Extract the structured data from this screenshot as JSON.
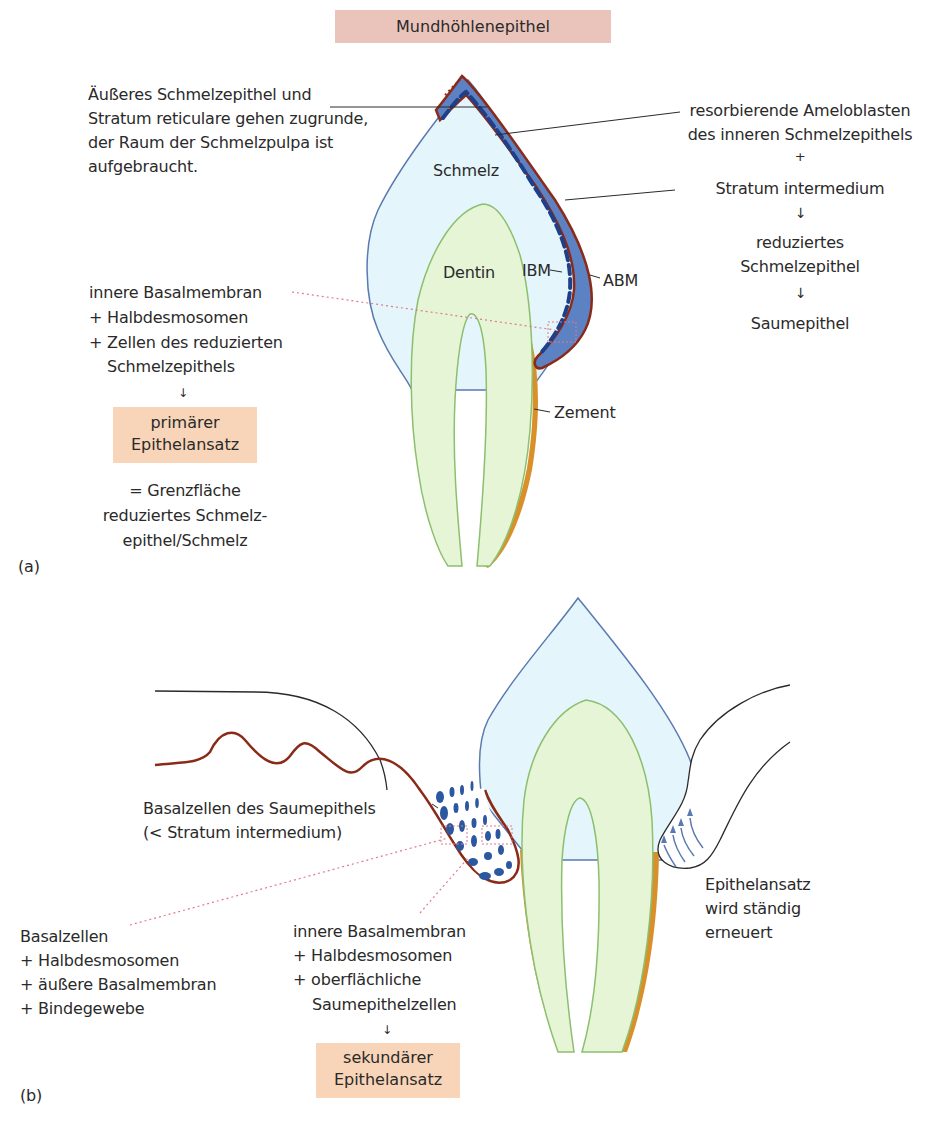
{
  "colors": {
    "enamel_fill": "#e4f6fb",
    "enamel_stroke": "#5a7ab0",
    "dentin_fill": "#e5f5d6",
    "dentin_stroke": "#8cbf6f",
    "cement": "#d9902a",
    "epithelium_brown": "#8a2a18",
    "cell_blue": "#2c58a0",
    "band_blue": "#5d82c4",
    "dotted_pink": "#e07a8a",
    "header_box": "#eac4bb",
    "attachment_box": "#f8d5b8"
  },
  "panel_a": {
    "label": "(a)",
    "header": "Mundhöhlenepithel",
    "left_note": [
      "Äußeres Schmelzepithel und",
      "Stratum reticulare gehen zugrunde,",
      "der Raum der Schmelzpulpa ist",
      "aufgebraucht."
    ],
    "tissue_labels": {
      "enamel": "Schmelz",
      "dentin": "Dentin",
      "ibm": "IBM",
      "abm": "ABM",
      "cement": "Zement"
    },
    "right_flow": {
      "line1": "resorbierende Ameloblasten",
      "line2": "des inneren Schmelzepithels",
      "plus": "+",
      "line3": "Stratum intermedium",
      "step2_line1": "reduziertes",
      "step2_line2": "Schmelzepithel",
      "step3": "Saumepithel"
    },
    "attachment_components": [
      "innere Basalmembran",
      "+ Halbdesmosomen",
      "+ Zellen des reduzierten",
      "Schmelzepithels"
    ],
    "attachment_result": [
      "primärer",
      "Epithelansatz"
    ],
    "definition": [
      "= Grenzfläche",
      "reduziertes Schmelz-",
      "epithel/Schmelz"
    ]
  },
  "panel_b": {
    "label": "(b)",
    "basal_cells_label": [
      "Basalzellen des Saumepithels",
      "(< Stratum intermedium)"
    ],
    "outer_components": [
      "Basalzellen",
      "+ Halbdesmosomen",
      "+ äußere Basalmembran",
      "+ Bindegewebe"
    ],
    "inner_components": [
      "innere Basalmembran",
      "+ Halbdesmosomen",
      "+ oberflächliche",
      "Saumepithelzellen"
    ],
    "attachment_result": [
      "sekundärer",
      "Epithelansatz"
    ],
    "renewal_note": [
      "Epithelansatz",
      "wird ständig",
      "erneuert"
    ]
  }
}
